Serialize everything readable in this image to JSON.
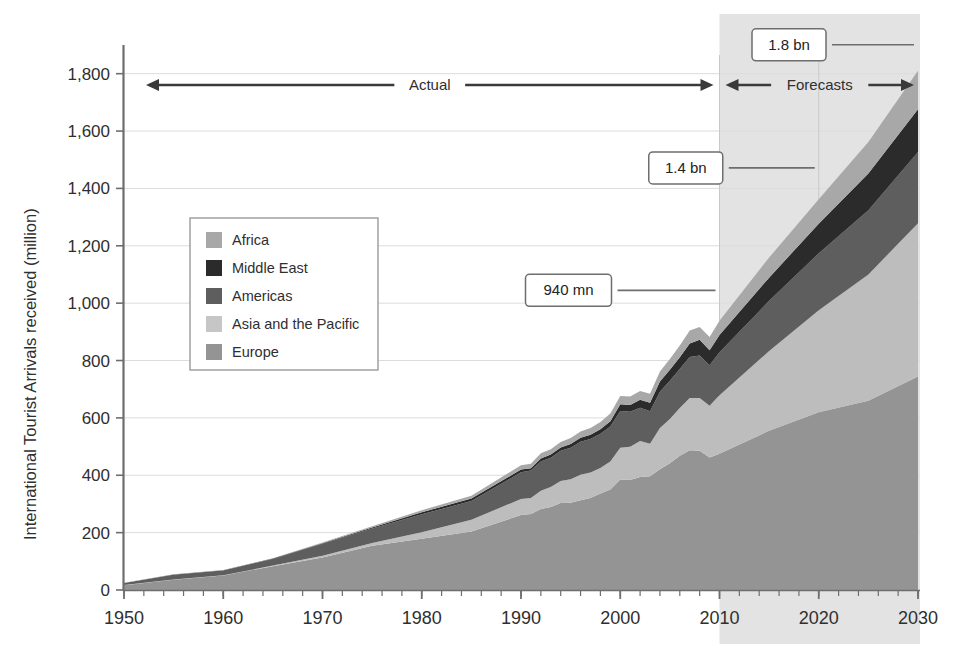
{
  "chart_data": {
    "type": "area",
    "stacked": true,
    "title": "",
    "xlabel": "",
    "ylabel": "International Tourist Arrivals received (million)",
    "xlim": [
      1950,
      2030
    ],
    "ylim": [
      0,
      1900
    ],
    "ytick_labels": [
      "0",
      "200",
      "400",
      "600",
      "800",
      "1,000",
      "1,200",
      "1,400",
      "1,600",
      "1,800"
    ],
    "ytick_values": [
      0,
      200,
      400,
      600,
      800,
      1000,
      1200,
      1400,
      1600,
      1800
    ],
    "xtick_labels": [
      "1950",
      "1960",
      "1970",
      "1980",
      "1990",
      "2000",
      "2010",
      "2020",
      "2030"
    ],
    "xtick_values": [
      1950,
      1960,
      1970,
      1980,
      1990,
      2000,
      2010,
      2020,
      2030
    ],
    "grid": true,
    "legend_position": "upper-left-inside",
    "stack_order_bottom_to_top": [
      "Europe",
      "Asia and the Pacific",
      "Americas",
      "Middle East",
      "Africa"
    ],
    "x": [
      1950,
      1955,
      1960,
      1965,
      1970,
      1975,
      1980,
      1985,
      1990,
      1991,
      1992,
      1993,
      1994,
      1995,
      1996,
      1997,
      1998,
      1999,
      2000,
      2001,
      2002,
      2003,
      2004,
      2005,
      2006,
      2007,
      2008,
      2009,
      2010,
      2015,
      2020,
      2025,
      2030
    ],
    "series": [
      {
        "name": "Europe",
        "color": "#949494",
        "values": [
          16.8,
          36.0,
          50.4,
          83.0,
          113.0,
          153.9,
          178.5,
          204.0,
          261.5,
          265.0,
          282.0,
          289.0,
          303.0,
          304.1,
          313.0,
          321.0,
          336.0,
          350.0,
          385.6,
          383.8,
          394.3,
          396.6,
          420.9,
          441.6,
          468.4,
          487.4,
          485.2,
          461.5,
          475.3,
          555,
          620,
          660,
          744
        ]
      },
      {
        "name": "Asia and the Pacific",
        "color": "#bdbdbd",
        "values": [
          0.2,
          0.9,
          0.9,
          2.1,
          6.2,
          10.2,
          23.0,
          41.0,
          55.8,
          56.0,
          64.0,
          70.0,
          77.0,
          82.4,
          89.0,
          89.0,
          89.0,
          98.0,
          110.1,
          115.7,
          124.9,
          113.3,
          144.2,
          154.6,
          166.0,
          182.0,
          184.1,
          181.1,
          204.0,
          278,
          355,
          440,
          535
        ]
      },
      {
        "name": "Americas",
        "color": "#5e5e5e",
        "values": [
          7.5,
          16.7,
          16.7,
          23.2,
          42.3,
          50.0,
          62.3,
          65.0,
          92.8,
          95.3,
          102.1,
          102.4,
          105.1,
          109.0,
          114.5,
          116.2,
          119.5,
          121.9,
          128.2,
          122.1,
          116.6,
          113.1,
          125.7,
          133.3,
          135.8,
          142.9,
          147.8,
          140.6,
          149.8,
          175,
          199,
          224,
          248
        ]
      },
      {
        "name": "Middle East",
        "color": "#2b2b2b",
        "values": [
          0.2,
          0.6,
          0.6,
          1.4,
          1.9,
          3.5,
          7.1,
          9.0,
          9.6,
          8.0,
          10.5,
          11.0,
          12.0,
          13.7,
          14.6,
          15.2,
          15.7,
          18.2,
          24.1,
          23.6,
          27.8,
          29.5,
          36.3,
          38.4,
          41.0,
          47.0,
          55.2,
          52.9,
          60.3,
          81,
          103,
          128,
          149
        ]
      },
      {
        "name": "Africa",
        "color": "#a8a8a8",
        "values": [
          0.5,
          0.8,
          0.8,
          1.4,
          2.4,
          4.7,
          7.2,
          9.7,
          15.2,
          16.1,
          18.3,
          18.7,
          19.1,
          20.4,
          21.9,
          23.2,
          25.4,
          27.2,
          28.3,
          29.1,
          30.0,
          31.6,
          34.5,
          37.3,
          41.5,
          45.0,
          44.4,
          45.8,
          49.4,
          70,
          85,
          110,
          134
        ]
      }
    ],
    "annotations": [
      {
        "name": "callout-940mn",
        "label": "940 mn",
        "year": 2010,
        "value": 940
      },
      {
        "name": "callout-14bn",
        "label": "1.4 bn",
        "year": 2020,
        "value": 1360
      },
      {
        "name": "callout-18bn",
        "label": "1.8 bn",
        "year": 2030,
        "value": 1810
      }
    ],
    "period_markers": [
      {
        "name": "actual",
        "label": "Actual",
        "from": 1950,
        "to": 2010
      },
      {
        "name": "forecasts",
        "label": "Forecasts",
        "from": 2010,
        "to": 2030
      }
    ],
    "forecast_shading": {
      "from": 2010,
      "to": 2030,
      "color": "#e3e3e3"
    }
  },
  "legend": {
    "items": [
      {
        "label": "Africa",
        "color": "#a8a8a8"
      },
      {
        "label": "Middle East",
        "color": "#2b2b2b"
      },
      {
        "label": "Americas",
        "color": "#5e5e5e"
      },
      {
        "label": "Asia and the Pacific",
        "color": "#c6c6c6"
      },
      {
        "label": "Europe",
        "color": "#949494"
      }
    ]
  },
  "colors": {
    "background": "#ffffff",
    "grid": "#dcdcdc",
    "axis": "#6e6e6e",
    "text": "#2f2f2f",
    "forecast_band": "#e3e3e3"
  }
}
